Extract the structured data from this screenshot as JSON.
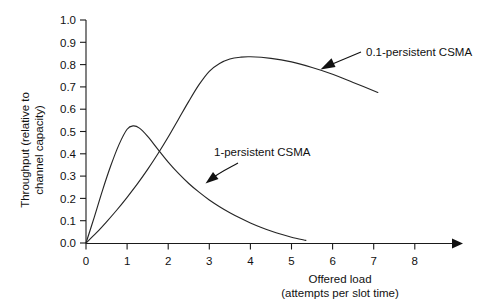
{
  "chart_data": {
    "type": "line",
    "title": "",
    "xlabel": "Offered load (attempts per slot time)",
    "xlabel_line1": "Offered load",
    "xlabel_line2": "(attempts per slot time)",
    "ylabel": "Throughput (relative to channel capacity)",
    "ylabel_line1": "Throughput (relative to",
    "ylabel_line2": "channel capacity)",
    "xlim": [
      0,
      8
    ],
    "ylim": [
      0.0,
      1.0
    ],
    "grid": false,
    "legend_position": "inline-annotations",
    "xticks": [
      "0",
      "1",
      "2",
      "3",
      "4",
      "5",
      "6",
      "7",
      "8"
    ],
    "xtick_values": [
      0,
      1,
      2,
      3,
      4,
      5,
      6,
      7,
      8
    ],
    "yticks": [
      "0.0",
      "0.1",
      "0.2",
      "0.3",
      "0.4",
      "0.5",
      "0.6",
      "0.7",
      "0.8",
      "0.9",
      "1.0"
    ],
    "ytick_values": [
      0.0,
      0.1,
      0.2,
      0.3,
      0.4,
      0.5,
      0.6,
      0.7,
      0.8,
      0.9,
      1.0
    ],
    "series": [
      {
        "name": "0.1-persistent CSMA",
        "x": [
          0.0,
          0.25,
          0.5,
          0.75,
          1.0,
          1.25,
          1.5,
          1.75,
          2.0,
          2.25,
          2.5,
          2.75,
          3.0,
          3.25,
          3.5,
          3.75,
          4.0,
          4.5,
          5.0,
          5.5,
          6.0,
          6.5,
          7.1
        ],
        "values": [
          0.0,
          0.045,
          0.095,
          0.148,
          0.205,
          0.265,
          0.33,
          0.4,
          0.475,
          0.555,
          0.635,
          0.71,
          0.77,
          0.805,
          0.825,
          0.833,
          0.835,
          0.828,
          0.812,
          0.787,
          0.757,
          0.72,
          0.675
        ]
      },
      {
        "name": "1-persistent CSMA",
        "x": [
          0.0,
          0.2,
          0.4,
          0.6,
          0.8,
          1.0,
          1.15,
          1.3,
          1.5,
          1.75,
          2.0,
          2.25,
          2.5,
          2.75,
          3.0,
          3.25,
          3.5,
          3.75,
          4.0,
          4.25,
          4.5,
          4.75,
          5.0,
          5.35
        ],
        "values": [
          0.0,
          0.115,
          0.235,
          0.345,
          0.44,
          0.51,
          0.525,
          0.515,
          0.478,
          0.42,
          0.363,
          0.312,
          0.267,
          0.228,
          0.193,
          0.163,
          0.136,
          0.112,
          0.09,
          0.071,
          0.054,
          0.039,
          0.026,
          0.012
        ]
      }
    ],
    "annotations": [
      {
        "text": "0.1-persistent CSMA",
        "points_to_series": "0.1-persistent CSMA",
        "target_x": 5.95,
        "target_y": 0.762
      },
      {
        "text": "1-persistent CSMA",
        "points_to_series": "1-persistent CSMA",
        "target_x": 3.0,
        "target_y": 0.275
      }
    ]
  }
}
